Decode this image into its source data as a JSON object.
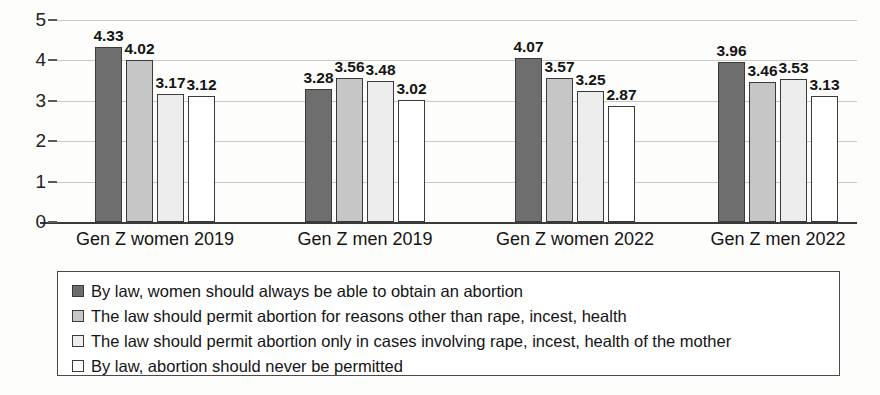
{
  "chart_data": {
    "type": "bar",
    "title": "",
    "xlabel": "",
    "ylabel": "",
    "ylim": [
      0,
      5
    ],
    "yticks": [
      "0",
      "1",
      "2",
      "3",
      "4",
      "5"
    ],
    "grid": true,
    "legend_position": "bottom",
    "categories": [
      "Gen Z women 2019",
      "Gen Z men 2019",
      "Gen Z women 2022",
      "Gen Z men 2022"
    ],
    "series": [
      {
        "name": "By law, women should always be able to obtain an abortion",
        "color": "#6e6e6e",
        "values": [
          4.33,
          3.28,
          4.07,
          3.96
        ],
        "labels": [
          "4.33",
          "3.28",
          "4.07",
          "3.96"
        ]
      },
      {
        "name": "The law should permit abortion for reasons other than rape, incest, health",
        "color": "#c6c6c6",
        "values": [
          4.02,
          3.56,
          3.57,
          3.46
        ],
        "labels": [
          "4.02",
          "3.56",
          "3.57",
          "3.46"
        ]
      },
      {
        "name": "The law should permit abortion only in cases involving rape, incest, health of the mother",
        "color": "#ededed",
        "values": [
          3.17,
          3.48,
          3.25,
          3.53
        ],
        "labels": [
          "3.17",
          "3.48",
          "3.25",
          "3.53"
        ]
      },
      {
        "name": "By law, abortion should never be permitted",
        "color": "#ffffff",
        "values": [
          3.12,
          3.02,
          2.87,
          3.13
        ],
        "labels": [
          "3.12",
          "3.02",
          "2.87",
          "3.13"
        ]
      }
    ]
  },
  "axis": {
    "y_ticks": [
      "5",
      "4",
      "3",
      "2",
      "1",
      "0"
    ]
  },
  "legend": {
    "entries": [
      "By law, women should always be able to obtain an abortion",
      "The law should permit abortion for reasons other than rape, incest, health",
      "The law should permit abortion only in cases involving rape, incest, health of the mother",
      "By law, abortion should never be permitted"
    ]
  }
}
